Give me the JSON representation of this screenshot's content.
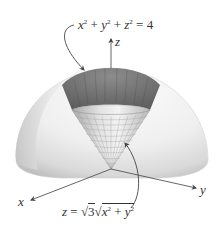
{
  "figure": {
    "sphere_equation": {
      "lhs_terms": [
        "x",
        "y",
        "z"
      ],
      "exponent": "2",
      "rhs": "4",
      "text": "x² + y² + z² = 4"
    },
    "cone_equation": {
      "lhs": "z",
      "coefficient_radicand": "3",
      "radicand_terms": [
        "x",
        "y"
      ],
      "exponent": "2",
      "text": "z = √3 √(x² + y²)"
    },
    "axes": {
      "x": "x",
      "y": "y",
      "z": "z"
    },
    "colors": {
      "sphere_light": "#eeeeee",
      "sphere_shadow": "#c8c8c8",
      "cap_dark": "#7a7a7a",
      "cone_mesh": "#999999",
      "axis_line": "#555555",
      "text": "#333333"
    }
  }
}
